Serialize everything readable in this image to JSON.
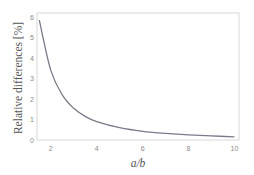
{
  "chart_data": {
    "type": "line",
    "title": "",
    "xlabel": "a/b",
    "ylabel": "Relative differences [%]",
    "xlim": [
      1.4,
      10.2
    ],
    "ylim": [
      0,
      6.2
    ],
    "xticks": [
      2,
      4,
      6,
      8,
      10
    ],
    "yticks": [
      0,
      1,
      2,
      3,
      4,
      5,
      6
    ],
    "grid": false,
    "legend": null,
    "series": [
      {
        "name": "Relative differences",
        "color": "#7a7a8a",
        "x": [
          1.5,
          2,
          2.5,
          3,
          3.5,
          4,
          5,
          6,
          7,
          8,
          9,
          10
        ],
        "y": [
          5.85,
          3.4,
          2.2,
          1.55,
          1.15,
          0.9,
          0.6,
          0.42,
          0.32,
          0.25,
          0.2,
          0.15
        ]
      }
    ]
  }
}
